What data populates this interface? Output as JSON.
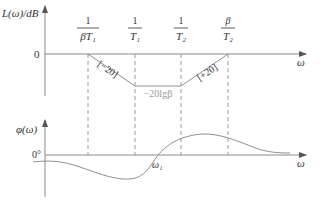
{
  "magnitude_plot": {
    "y_axis_label": "L(ω)/dB",
    "x_axis_label": "ω",
    "zero_label": "0",
    "breakpoints": [
      {
        "numerator": "1",
        "denominator": "βT₁"
      },
      {
        "numerator": "1",
        "denominator": "T₁"
      },
      {
        "numerator": "1",
        "denominator": "T₂"
      },
      {
        "numerator": "β",
        "denominator": "T₂"
      }
    ],
    "slope_labels": {
      "falling": "[−20]",
      "rising": "[+20]"
    },
    "flat_level_label": "−20lgβ"
  },
  "phase_plot": {
    "y_axis_label": "φ(ω)",
    "x_axis_label": "ω",
    "zero_label": "0°",
    "crossing_label": "ω₁"
  },
  "colors": {
    "axis": "#8a8a8a",
    "curve": "#8f8f8f",
    "text": "#333333",
    "muted_text": "#9a9a9a"
  }
}
